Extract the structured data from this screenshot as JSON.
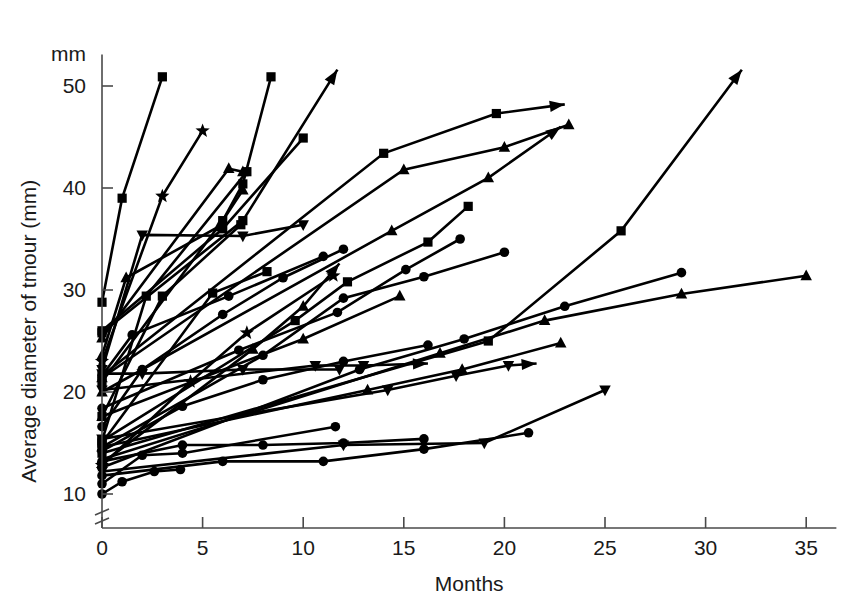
{
  "figure": {
    "background_color": "#ffffff",
    "ink_color": "#000000",
    "axis_color": "#4a4a4a"
  },
  "chart_data": {
    "type": "line",
    "title": "",
    "subtitle": "",
    "xlabel": "Months",
    "ylabel": "Average diameter of tmour (mm)",
    "y_unit_label": "mm",
    "xlim": [
      0,
      36.5
    ],
    "ylim": [
      8.6,
      52.5
    ],
    "xticks": [
      0,
      5,
      10,
      15,
      20,
      25,
      30,
      35
    ],
    "xticklabels": [
      "0",
      "5",
      "10",
      "15",
      "20",
      "25",
      "30",
      "35"
    ],
    "yticks": [
      10,
      20,
      30,
      40,
      50
    ],
    "yticklabels": [
      "10",
      "20",
      "30",
      "40",
      "50"
    ],
    "grid": false,
    "legend": null,
    "legend_position": "none",
    "y_axis_break": true,
    "y_axis_break_note": "double slash break between 0 and 10 on the y axis",
    "annotations": [],
    "marker_kinds": [
      "circle",
      "square",
      "triangle-up",
      "triangle-down",
      "star"
    ],
    "series": [
      {
        "name": "patient-01",
        "marker": "square",
        "arrow_end": false,
        "x": [
          0,
          1,
          3
        ],
        "y": [
          28.8,
          39.0,
          50.9
        ]
      },
      {
        "name": "patient-02",
        "marker": "star",
        "arrow_end": false,
        "x": [
          0,
          3,
          5
        ],
        "y": [
          23.0,
          39.2,
          45.6
        ]
      },
      {
        "name": "patient-03",
        "marker": "square",
        "arrow_end": false,
        "x": [
          0,
          6,
          7,
          8.4
        ],
        "y": [
          21.0,
          36.8,
          40.4,
          50.9
        ]
      },
      {
        "name": "patient-04",
        "marker": "triangle-up",
        "arrow_end": false,
        "x": [
          0,
          6.3,
          7.0
        ],
        "y": [
          25.3,
          41.9,
          41.6
        ]
      },
      {
        "name": "patient-05",
        "marker": "square",
        "arrow_end": true,
        "x": [
          0,
          7,
          11.7
        ],
        "y": [
          25.8,
          36.8,
          51.6
        ]
      },
      {
        "name": "patient-06",
        "marker": "square",
        "arrow_end": false,
        "x": [
          0,
          6,
          10
        ],
        "y": [
          26.0,
          36.0,
          44.9
        ]
      },
      {
        "name": "patient-07",
        "marker": "triangle-down",
        "arrow_end": false,
        "x": [
          0,
          2,
          7,
          10
        ],
        "y": [
          22.2,
          35.4,
          35.3,
          36.4
        ]
      },
      {
        "name": "patient-08",
        "marker": "square",
        "arrow_end": true,
        "x": [
          0,
          14,
          19.6,
          23
        ],
        "y": [
          21.6,
          43.4,
          47.3,
          48.2
        ]
      },
      {
        "name": "patient-09",
        "marker": "triangle-up",
        "arrow_end": false,
        "x": [
          0,
          15,
          20,
          23.2
        ],
        "y": [
          21.4,
          41.8,
          44.0,
          46.2
        ]
      },
      {
        "name": "patient-10",
        "marker": "triangle-up",
        "arrow_end": true,
        "x": [
          0,
          14.4,
          19.2,
          22.8
        ],
        "y": [
          20.0,
          35.8,
          41.0,
          46.0
        ]
      },
      {
        "name": "patient-11",
        "marker": "square",
        "arrow_end": false,
        "x": [
          0,
          2.2,
          7.2
        ],
        "y": [
          15.2,
          29.4,
          41.6
        ]
      },
      {
        "name": "patient-12",
        "marker": "triangle-up",
        "arrow_end": false,
        "x": [
          0,
          1.2,
          5.8,
          7.0
        ],
        "y": [
          23.6,
          31.2,
          36.2,
          39.8
        ]
      },
      {
        "name": "patient-13",
        "marker": "square",
        "arrow_end": false,
        "x": [
          0,
          3,
          6.9
        ],
        "y": [
          17.6,
          29.4,
          36.4
        ]
      },
      {
        "name": "patient-14",
        "marker": "square",
        "arrow_end": false,
        "x": [
          0,
          5.5,
          8.2
        ],
        "y": [
          15.0,
          29.7,
          31.8
        ]
      },
      {
        "name": "patient-15",
        "marker": "circle",
        "arrow_end": false,
        "x": [
          0,
          1.5,
          6.3,
          11
        ],
        "y": [
          21.6,
          25.6,
          29.4,
          33.3
        ]
      },
      {
        "name": "patient-16",
        "marker": "circle",
        "arrow_end": false,
        "x": [
          0,
          2,
          6,
          9,
          12
        ],
        "y": [
          16.6,
          22.2,
          27.6,
          31.2,
          34.0
        ]
      },
      {
        "name": "patient-17",
        "marker": "square",
        "arrow_end": false,
        "x": [
          0,
          9.6,
          12.2,
          16.2,
          18.2
        ],
        "y": [
          15.2,
          27.0,
          30.8,
          34.7,
          38.2
        ]
      },
      {
        "name": "patient-18",
        "marker": "circle",
        "arrow_end": false,
        "x": [
          0,
          8,
          12,
          16,
          20
        ],
        "y": [
          14.6,
          23.6,
          29.2,
          31.3,
          33.7
        ]
      },
      {
        "name": "patient-19",
        "marker": "circle",
        "arrow_end": false,
        "x": [
          0,
          6.8,
          11.7,
          15.1,
          17.8
        ],
        "y": [
          18.4,
          24.1,
          27.8,
          32.0,
          35.0
        ]
      },
      {
        "name": "patient-20",
        "marker": "star",
        "arrow_end": false,
        "x": [
          0,
          4.4,
          7.2,
          11.5
        ],
        "y": [
          12.8,
          21.0,
          25.8,
          31.4
        ]
      },
      {
        "name": "patient-21",
        "marker": "triangle-up",
        "arrow_end": true,
        "x": [
          0,
          7.5,
          10.0,
          11.8
        ],
        "y": [
          13.0,
          24.2,
          28.4,
          32.6
        ]
      },
      {
        "name": "patient-22",
        "marker": "triangle-up",
        "arrow_end": false,
        "x": [
          0,
          10,
          14.8
        ],
        "y": [
          17.6,
          25.2,
          29.4
        ]
      },
      {
        "name": "patient-23",
        "marker": "triangle-down",
        "arrow_end": false,
        "x": [
          0,
          2.0,
          7.0,
          11.8
        ],
        "y": [
          21.8,
          21.8,
          22.2,
          22.2
        ]
      },
      {
        "name": "patient-24",
        "marker": "triangle-down",
        "arrow_end": true,
        "x": [
          0,
          10.6,
          13.0,
          16.2
        ],
        "y": [
          20.2,
          22.6,
          22.6,
          22.8
        ]
      },
      {
        "name": "patient-25",
        "marker": "circle",
        "arrow_end": false,
        "x": [
          0,
          4,
          8,
          12,
          16.2
        ],
        "y": [
          14.2,
          18.6,
          21.2,
          23.0,
          24.6
        ]
      },
      {
        "name": "patient-26",
        "marker": "triangle-down",
        "arrow_end": true,
        "x": [
          0,
          14.2,
          17.6,
          20.2,
          21.6
        ],
        "y": [
          15.4,
          20.2,
          21.6,
          22.6,
          22.8
        ]
      },
      {
        "name": "patient-27",
        "marker": "triangle-up",
        "arrow_end": false,
        "x": [
          0,
          13.2,
          17.9,
          22.8
        ],
        "y": [
          14.6,
          20.2,
          22.2,
          24.8
        ]
      },
      {
        "name": "patient-28",
        "marker": "triangle-up",
        "arrow_end": false,
        "x": [
          0,
          16.8,
          22.0,
          28.8,
          35.0
        ],
        "y": [
          13.4,
          23.8,
          27.0,
          29.6,
          31.4
        ]
      },
      {
        "name": "patient-29",
        "marker": "circle",
        "arrow_end": false,
        "x": [
          0,
          12.8,
          18.0,
          23.0,
          28.8
        ],
        "y": [
          12.6,
          22.2,
          25.2,
          28.4,
          31.7
        ]
      },
      {
        "name": "patient-30",
        "marker": "square",
        "arrow_end": true,
        "x": [
          0,
          19.2,
          25.8,
          31.8
        ],
        "y": [
          14.0,
          25.0,
          35.8,
          51.6
        ]
      },
      {
        "name": "patient-31",
        "marker": "triangle-down",
        "arrow_end": false,
        "x": [
          0,
          12.0,
          19.0,
          25.0
        ],
        "y": [
          12.2,
          14.8,
          15.0,
          20.2
        ]
      },
      {
        "name": "patient-32",
        "marker": "circle",
        "arrow_end": false,
        "x": [
          0,
          6,
          11,
          16,
          21.2
        ],
        "y": [
          11.8,
          13.2,
          13.2,
          14.4,
          16.0
        ]
      },
      {
        "name": "patient-33",
        "marker": "circle",
        "arrow_end": false,
        "x": [
          0,
          4,
          8,
          12,
          16
        ],
        "y": [
          13.2,
          14.8,
          14.8,
          15.0,
          15.4
        ]
      },
      {
        "name": "patient-34",
        "marker": "circle",
        "arrow_end": false,
        "x": [
          0,
          2,
          4,
          11.6
        ],
        "y": [
          11.0,
          13.8,
          14.0,
          16.6
        ]
      },
      {
        "name": "patient-35",
        "marker": "circle",
        "arrow_end": false,
        "x": [
          0,
          1,
          2.6,
          3.9
        ],
        "y": [
          10.0,
          11.2,
          12.2,
          12.4
        ]
      }
    ]
  }
}
